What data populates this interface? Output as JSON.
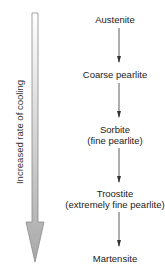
{
  "diagram": {
    "side_label": "Increased rate of cooling",
    "stages": [
      {
        "name": "Austenite",
        "detail": ""
      },
      {
        "name": "Coarse pearlite",
        "detail": ""
      },
      {
        "name": "Sorbite",
        "detail": "(fine pearlite)"
      },
      {
        "name": "Troostite",
        "detail": "(extremely fine pearlite)"
      },
      {
        "name": "Martensite",
        "detail": ""
      }
    ],
    "colors": {
      "arrow_top": "#ffffff",
      "arrow_bottom": "#a8a8a8",
      "arrow_outline": "#8a8a8a",
      "text": "#222222"
    }
  }
}
